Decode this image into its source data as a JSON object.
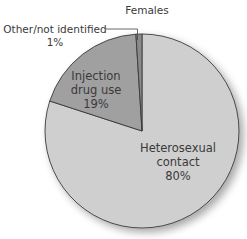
{
  "chart_data": {
    "type": "pie",
    "title": "Females",
    "categories": [
      "Heterosexual contact",
      "Injection drug use",
      "Other/not identified"
    ],
    "values": [
      80,
      19,
      1
    ],
    "labels": [
      "80%",
      "19%",
      "1%"
    ],
    "colors": [
      "#cfcfcf",
      "#a0a0a0",
      "#8a8a8a"
    ],
    "start_angle_deg": 0,
    "direction": "clockwise",
    "legend": "none (direct labels)"
  },
  "labels": {
    "title": "Females",
    "heterosexual_line1": "Heterosexual",
    "heterosexual_line2": "contact",
    "heterosexual_pct": "80%",
    "injection_line1": "Injection",
    "injection_line2": "drug use",
    "injection_pct": "19%",
    "other_line1": "Other/not identified",
    "other_pct": "1%"
  }
}
